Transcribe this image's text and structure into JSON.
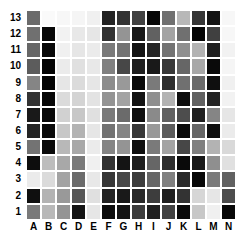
{
  "chart_data": {
    "type": "heatmap",
    "title": "",
    "subtitle": "",
    "xlabel": "",
    "ylabel": "",
    "legend_position": "none",
    "grid": true,
    "colormap": "grayscale",
    "colormap_low_color": "#ffffff",
    "colormap_high_color": "#000000",
    "value_range": [
      0,
      100
    ],
    "x_categories": [
      "A",
      "B",
      "C",
      "D",
      "E",
      "F",
      "G",
      "H",
      "I",
      "J",
      "K",
      "L",
      "M",
      "N"
    ],
    "y_categories": [
      "1",
      "2",
      "3",
      "4",
      "5",
      "6",
      "7",
      "8",
      "9",
      "10",
      "11",
      "12",
      "13"
    ],
    "row_order": "bottom-to-top",
    "rows": [
      {
        "label": "13",
        "values": [
          58,
          2,
          3,
          4,
          6,
          86,
          80,
          74,
          97,
          56,
          28,
          79,
          92,
          3
        ]
      },
      {
        "label": "12",
        "values": [
          56,
          97,
          5,
          9,
          10,
          80,
          42,
          90,
          62,
          36,
          56,
          98,
          75,
          3
        ]
      },
      {
        "label": "11",
        "values": [
          60,
          97,
          6,
          10,
          8,
          52,
          55,
          92,
          86,
          55,
          44,
          30,
          88,
          5
        ]
      },
      {
        "label": "10",
        "values": [
          64,
          98,
          8,
          12,
          9,
          50,
          72,
          88,
          90,
          78,
          60,
          34,
          96,
          4
        ]
      },
      {
        "label": "9",
        "values": [
          48,
          98,
          10,
          14,
          10,
          45,
          40,
          96,
          52,
          82,
          56,
          58,
          94,
          6
        ]
      },
      {
        "label": "8",
        "values": [
          80,
          97,
          14,
          17,
          11,
          42,
          36,
          92,
          44,
          30,
          95,
          62,
          86,
          5
        ]
      },
      {
        "label": "7",
        "values": [
          90,
          96,
          18,
          22,
          12,
          52,
          58,
          94,
          46,
          62,
          70,
          88,
          48,
          10
        ]
      },
      {
        "label": "6",
        "values": [
          86,
          96,
          22,
          30,
          10,
          55,
          48,
          78,
          40,
          64,
          96,
          60,
          94,
          8
        ]
      },
      {
        "label": "5",
        "values": [
          55,
          96,
          28,
          34,
          8,
          48,
          42,
          94,
          52,
          36,
          72,
          50,
          30,
          15
        ]
      },
      {
        "label": "4",
        "values": [
          95,
          26,
          34,
          52,
          6,
          80,
          92,
          88,
          60,
          82,
          96,
          90,
          44,
          12
        ]
      },
      {
        "label": "3",
        "values": [
          8,
          14,
          36,
          58,
          9,
          78,
          72,
          76,
          60,
          50,
          84,
          97,
          52,
          62
        ]
      },
      {
        "label": "2",
        "values": [
          94,
          30,
          40,
          66,
          12,
          86,
          90,
          84,
          76,
          88,
          80,
          16,
          10,
          70
        ]
      },
      {
        "label": "1",
        "values": [
          52,
          28,
          42,
          92,
          10,
          95,
          92,
          76,
          88,
          74,
          96,
          22,
          6,
          97
        ]
      }
    ]
  }
}
